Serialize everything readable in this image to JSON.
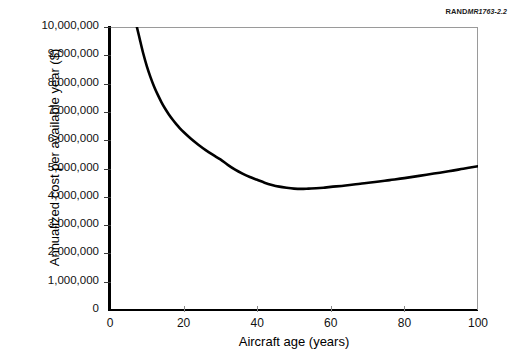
{
  "credit": {
    "brand": "RAND",
    "document_id": "MR1763-2.2"
  },
  "chart_data": {
    "type": "line",
    "title": "",
    "xlabel": "Aircraft age (years)",
    "ylabel": "Annualized cost per available year ($)",
    "xlim": [
      0,
      100
    ],
    "ylim": [
      0,
      10000000
    ],
    "grid": false,
    "legend": null,
    "xticks": [
      0,
      20,
      40,
      60,
      80,
      100
    ],
    "xticklabels": [
      "0",
      "20",
      "40",
      "60",
      "80",
      "100"
    ],
    "yticks": [
      0,
      1000000,
      2000000,
      3000000,
      4000000,
      5000000,
      6000000,
      7000000,
      8000000,
      9000000,
      10000000
    ],
    "yticklabels": [
      "0",
      "1,000,000",
      "2,000,000",
      "3,000,000",
      "4,000,000",
      "5,000,000",
      "6,000,000",
      "7,000,000",
      "8,000,000",
      "9,000,000",
      "10,000,000"
    ],
    "series": [
      {
        "name": "Annualized cost per available year",
        "color": "#000000",
        "x": [
          7.3,
          8,
          9,
          10,
          11,
          12,
          13,
          14,
          15,
          16,
          17,
          18,
          19,
          20,
          22,
          24,
          26,
          28,
          30,
          32,
          34,
          36,
          38,
          40,
          42,
          44,
          46,
          48,
          50,
          52,
          54,
          56,
          58,
          60,
          64,
          68,
          72,
          76,
          80,
          84,
          88,
          92,
          96,
          100
        ],
        "y": [
          10000000,
          9620000,
          9080000,
          8620000,
          8230000,
          7890000,
          7600000,
          7340000,
          7110000,
          6910000,
          6730000,
          6570000,
          6420000,
          6290000,
          6050000,
          5840000,
          5650000,
          5480000,
          5320000,
          5130000,
          4960000,
          4820000,
          4700000,
          4600000,
          4500000,
          4420000,
          4360000,
          4320000,
          4290000,
          4280000,
          4290000,
          4300000,
          4320000,
          4350000,
          4400000,
          4460000,
          4520000,
          4590000,
          4660000,
          4740000,
          4820000,
          4900000,
          4990000,
          5080000
        ]
      }
    ],
    "annotations": [
      {
        "label": "minimum",
        "x": 51,
        "y": 4280000
      }
    ]
  }
}
